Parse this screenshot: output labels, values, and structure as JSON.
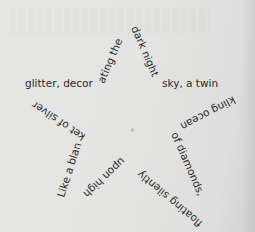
{
  "poem": {
    "shape": "star",
    "segments": [
      "glitter, decor",
      "ating the",
      "dark night",
      "sky, a twin",
      "kling ocean",
      "of diamonds,",
      "floating silently",
      "upon high",
      "Like a blan",
      "ket of silver"
    ],
    "full_text": "Like a blanket of silver glitter, decorating the dark night sky, a twinkling ocean of diamonds, floating silently upon high"
  },
  "colors": {
    "paper": "#e4e4e2",
    "ink": "#2a2a2a"
  }
}
